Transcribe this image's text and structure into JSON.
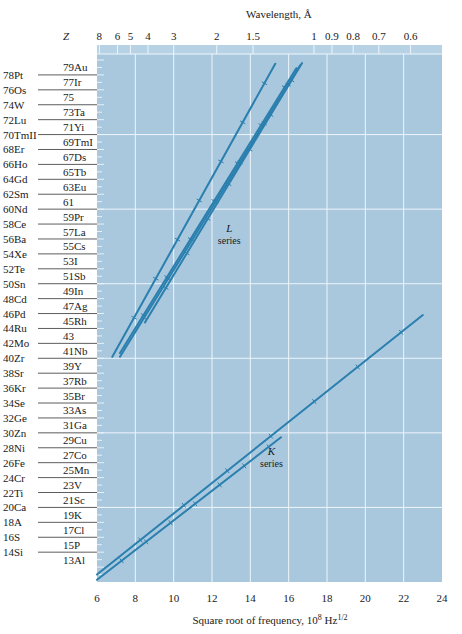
{
  "chart_data": {
    "type": "line",
    "xlabel": "Square root of frequency, 10^8 Hz^1/2",
    "xlabel_parts": {
      "main": "Square root of frequency, 10",
      "exp": "8",
      "unit": " Hz",
      "unit_exp": "1/2"
    },
    "x2label": "Wavelength, Å",
    "ylabel": "Z",
    "xlim": [
      6,
      24
    ],
    "ylim": [
      10,
      80
    ],
    "grid": true,
    "x_ticks": [
      6,
      8,
      10,
      12,
      14,
      16,
      18,
      20,
      22,
      24
    ],
    "x2_ticks": [
      "8",
      "6",
      "5",
      "4",
      "3",
      "2",
      "1.5",
      "1",
      "0.9",
      "0.8",
      "0.7",
      "0.6"
    ],
    "x2_tick_values": [
      8,
      6,
      5,
      4,
      3,
      2,
      1.5,
      1,
      0.9,
      0.8,
      0.7,
      0.6
    ],
    "y_left_labels": [
      "78Pt",
      "76Os",
      "74W",
      "72Lu",
      "70TmII",
      "68Er",
      "66Ho",
      "64Gd",
      "62Sm",
      "60Nd",
      "58Ce",
      "56Ba",
      "54Xe",
      "52Te",
      "50Sn",
      "48Cd",
      "46Pd",
      "44Ru",
      "42Mo",
      "40Zr",
      "38Sr",
      "36Kr",
      "34Se",
      "32Ge",
      "30Zn",
      "28Ni",
      "26Fe",
      "24Cr",
      "22Ti",
      "20Ca",
      "18A",
      "16S",
      "14Si"
    ],
    "y_left_z": [
      78,
      76,
      74,
      72,
      70,
      68,
      66,
      64,
      62,
      60,
      58,
      56,
      54,
      52,
      50,
      48,
      46,
      44,
      42,
      40,
      38,
      36,
      34,
      32,
      30,
      28,
      26,
      24,
      22,
      20,
      18,
      16,
      14
    ],
    "y_right_labels": [
      "79Au",
      "77Ir",
      "75",
      "73Ta",
      "71Yi",
      "69TmI",
      "67Ds",
      "65Tb",
      "63Eu",
      "61",
      "59Pr",
      "57La",
      "55Cs",
      "53I",
      "51Sb",
      "49In",
      "47Ag",
      "45Rh",
      "43",
      "41Nb",
      "39Y",
      "37Rb",
      "35Br",
      "33As",
      "31Ga",
      "29Cu",
      "27Co",
      "25Mn",
      "23V",
      "21Sc",
      "19K",
      "17Cl",
      "15P",
      "13Al"
    ],
    "y_right_z": [
      79,
      77,
      75,
      73,
      71,
      69,
      67,
      65,
      63,
      61,
      59,
      57,
      55,
      53,
      51,
      49,
      47,
      45,
      43,
      41,
      39,
      37,
      35,
      33,
      31,
      29,
      27,
      25,
      23,
      21,
      19,
      17,
      15,
      13
    ],
    "annotations": [
      {
        "text": "L",
        "sub": "series",
        "x": 12.9,
        "y": 57
      },
      {
        "text": "K",
        "sub": "series",
        "x": 15.1,
        "y": 27
      }
    ],
    "series": [
      {
        "name": "K series (Kα)",
        "x": [
          6.0,
          23.0
        ],
        "y": [
          11.0,
          45.8
        ]
      },
      {
        "name": "K series (Kβ)",
        "x": [
          6.0,
          15.6
        ],
        "y": [
          10.3,
          29.4
        ]
      },
      {
        "name": "L series 1",
        "x": [
          6.8,
          15.3
        ],
        "y": [
          40.2,
          79.5
        ]
      },
      {
        "name": "L series 2",
        "x": [
          7.2,
          16.4
        ],
        "y": [
          40.7,
          78.9
        ]
      },
      {
        "name": "L series 3",
        "x": [
          7.2,
          16.6
        ],
        "y": [
          40.2,
          79.3
        ]
      },
      {
        "name": "L series 4",
        "x": [
          8.5,
          16.7
        ],
        "y": [
          44.8,
          79.6
        ]
      }
    ],
    "colors": {
      "plot_bg": "#a9c8de",
      "grid": "#eef5fa",
      "line": "#2a7fae",
      "strip": "#b7d2e5"
    }
  }
}
